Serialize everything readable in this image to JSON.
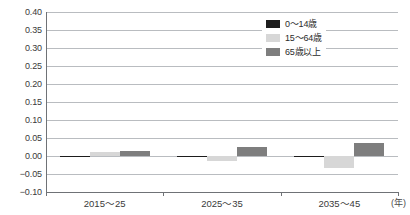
{
  "chart_data": {
    "type": "bar",
    "title": "",
    "xlabel": "(年)",
    "ylabel": "",
    "categories": [
      "2015〜25",
      "2025〜35",
      "2035〜45"
    ],
    "series": [
      {
        "name": "0〜14歳",
        "color": "#1d1d1d",
        "values": [
          -0.001,
          -0.004,
          -0.002
        ]
      },
      {
        "name": "15〜64歳",
        "color": "#d7d7d7",
        "values": [
          0.012,
          -0.015,
          -0.034
        ]
      },
      {
        "name": "65歳以上",
        "color": "#7e7e7e",
        "values": [
          0.014,
          0.026,
          0.036
        ]
      }
    ],
    "ylim": [
      -0.1,
      0.4
    ],
    "ytick_step": 0.05,
    "yticks": [
      "0.40",
      "0.35",
      "0.30",
      "0.25",
      "0.20",
      "0.15",
      "0.10",
      "0.05",
      "0.00",
      "-0.05",
      "-0.10"
    ],
    "ytick_values": [
      0.4,
      0.35,
      0.3,
      0.25,
      0.2,
      0.15,
      0.1,
      0.05,
      0.0,
      -0.05,
      -0.1
    ],
    "grid": true,
    "legend_position": "top-right"
  },
  "legend": {
    "items": [
      {
        "label": "0〜14歳"
      },
      {
        "label": "15〜64歳"
      },
      {
        "label": "65歳以上"
      }
    ]
  },
  "axis": {
    "unit": "(年)"
  },
  "caption": ""
}
